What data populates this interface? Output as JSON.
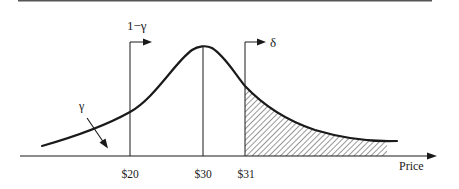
{
  "diagram": {
    "type": "probability-distribution-with-price-thresholds",
    "x_axis": {
      "label": "Price"
    },
    "ticks": [
      {
        "label": "$20",
        "x": 130
      },
      {
        "label": "$30",
        "x": 203
      },
      {
        "label": "$31",
        "x": 245
      }
    ],
    "annotations": {
      "one_minus_gamma": "1−γ",
      "gamma": "γ",
      "delta": "δ"
    },
    "shaded_region": {
      "from": "$31",
      "to": "right tail",
      "pattern": "diagonal-hatch"
    },
    "colors": {
      "ink": "#1a1a1a",
      "rule": "#555555",
      "background": "#ffffff"
    }
  }
}
